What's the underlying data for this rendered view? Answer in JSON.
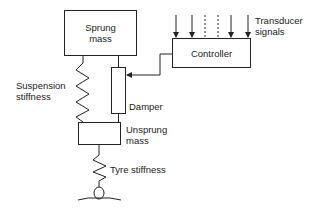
{
  "diagram": {
    "nodes": {
      "sprung_mass": {
        "label_line1": "Sprung",
        "label_line2": "mass"
      },
      "unsprung_mass": {
        "label_line1": "Unsprung",
        "label_line2": "mass"
      },
      "controller": {
        "label": "Controller"
      },
      "damper": {
        "label": "Damper"
      },
      "suspension_stiffness": {
        "label_line1": "Suspension",
        "label_line2": "stiffness"
      },
      "tyre_stiffness": {
        "label": "Tyre stiffness"
      },
      "transducer_signals": {
        "label_line1": "Transducer",
        "label_line2": "signals"
      }
    },
    "edges": [
      {
        "from": "sprung_mass",
        "to": "unsprung_mass",
        "via": "suspension_stiffness"
      },
      {
        "from": "sprung_mass",
        "to": "unsprung_mass",
        "via": "damper"
      },
      {
        "from": "unsprung_mass",
        "to": "ground",
        "via": "tyre_stiffness"
      },
      {
        "from": "controller",
        "to": "damper",
        "type": "arrow"
      },
      {
        "from": "transducer_signals",
        "to": "controller",
        "type": "arrows",
        "count": 6
      }
    ]
  }
}
